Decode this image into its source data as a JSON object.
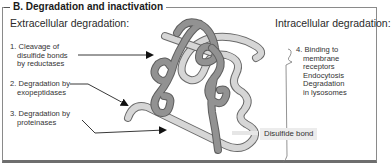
{
  "panel": {
    "title": "B. Degradation and inactivation"
  },
  "extracellular": {
    "heading": "Extracellular degradation:",
    "items": [
      {
        "number": "1.",
        "lines": [
          "Cleavage of",
          "disulfide bonds",
          "by reductases"
        ]
      },
      {
        "number": "2.",
        "lines": [
          "Degradation by",
          "exopeptidases"
        ]
      },
      {
        "number": "3.",
        "lines": [
          "Degradation by",
          "proteinases"
        ]
      }
    ]
  },
  "intracellular": {
    "heading": "Intracellular degradation:",
    "items": [
      {
        "number": "4.",
        "lines": [
          "Binding to",
          "membrane",
          "receptors",
          "Endocytosis",
          "Degradation",
          "in lysosomes"
        ]
      }
    ]
  },
  "annotations": {
    "disulfide_bond": "Disulfide bond"
  },
  "colors": {
    "dark_strand": "#8c8c8c",
    "light_strand": "#d4d4d4",
    "outline": "#6a6a6a",
    "frame": "#8a8a8a",
    "arrow": "#111111"
  }
}
